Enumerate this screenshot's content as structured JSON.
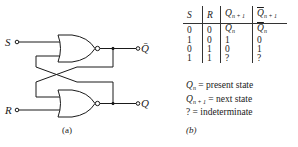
{
  "figure_a": {
    "caption": "(a)",
    "inputs": {
      "s": "S",
      "r": "R"
    },
    "outputs": {
      "q_bar": "Q̄",
      "q": "Q"
    },
    "gates": [
      "NOR",
      "NOR"
    ]
  },
  "figure_b": {
    "caption": "(b)",
    "table": {
      "headers": [
        "S",
        "R",
        "Qn+1",
        "Q̄n+1"
      ],
      "header_parts": [
        {
          "base": "S",
          "sub": ""
        },
        {
          "base": "R",
          "sub": ""
        },
        {
          "base": "Q",
          "sub": "n + 1"
        },
        {
          "base": "Q",
          "sub": "n + 1",
          "bar": true
        }
      ],
      "rows": [
        {
          "s": "0",
          "r": "0",
          "q_base": "Q",
          "q_sub": "n",
          "qb_base": "Q",
          "qb_sub": "n"
        },
        {
          "s": "1",
          "r": "0",
          "q": "1",
          "qb": "0"
        },
        {
          "s": "0",
          "r": "1",
          "q": "0",
          "qb": "1"
        },
        {
          "s": "1",
          "r": "1",
          "q": "?",
          "qb": "?"
        }
      ]
    },
    "legend": [
      {
        "symbol_base": "Q",
        "symbol_sub": "n",
        "text": " = present state"
      },
      {
        "symbol_base": "Q",
        "symbol_sub": "n + 1",
        "text": " = next state"
      },
      {
        "symbol_base": "?",
        "symbol_sub": "",
        "text": " = indeterminate"
      }
    ]
  }
}
